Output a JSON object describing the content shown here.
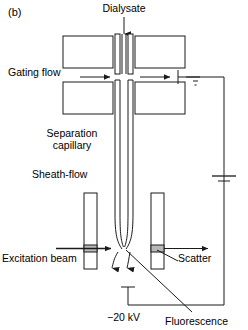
{
  "figure": {
    "panel_label": "(b)",
    "domain": "diagram",
    "type": "instrument-schematic",
    "background_color": "#ffffff",
    "line_color": "#1a1a1a"
  },
  "labels": {
    "dialysate": "Dialysate",
    "gating_flow": "Gating flow",
    "separation_capillary_line1": "Separation",
    "separation_capillary_line2": "capillary",
    "sheath_flow": "Sheath-flow",
    "excitation_beam": "Excitation beam",
    "scatter": "Scatter",
    "voltage": "−20 kV",
    "fluorescence": "Fluorescence"
  },
  "components": {
    "flow_gated_interface": {
      "name": "flow-gated injection interface",
      "upper_blocks": 2,
      "lower_blocks": 2,
      "gap_label": "injection gap"
    },
    "capillary": {
      "name": "separation capillary",
      "orientation": "vertical",
      "tapered_tip": true
    },
    "sheath_flow_cuvette": {
      "name": "sheath-flow cuvette",
      "walls": 2,
      "windows": 2
    },
    "ground": {
      "symbol": "earth-ground",
      "bars": 3
    },
    "power_supply": {
      "symbol": "battery",
      "value": "−20 kV"
    },
    "electrode": {
      "symbol": "electrode-stub",
      "position": "bottom-center"
    }
  },
  "arrows": {
    "dialysate_inlet": {
      "direction": "down",
      "label": "Dialysate"
    },
    "gating_flow_in": {
      "direction": "right",
      "label": "Gating flow"
    },
    "gating_flow_out": {
      "direction": "right",
      "label": "waste"
    },
    "excitation_in": {
      "direction": "right",
      "label": "Excitation beam"
    },
    "scatter_out": {
      "direction": "right",
      "label": "Scatter"
    },
    "sheath_down_left": {
      "direction": "down",
      "label": "sheath stream"
    },
    "sheath_down_right": {
      "direction": "down",
      "label": "sheath stream"
    }
  }
}
